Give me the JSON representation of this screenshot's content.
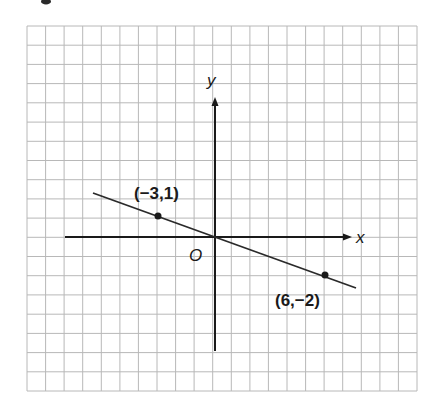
{
  "figure": {
    "type": "coordinate-plane-line",
    "colors": {
      "grid": "#b8b8b8",
      "ink": "#1a1a1a",
      "background": "#ffffff"
    }
  },
  "axes": {
    "x_label": "x",
    "y_label": "y",
    "origin_label": "O"
  },
  "points": [
    {
      "label": "(−3,1)",
      "x": -3,
      "y": 1
    },
    {
      "label": "(6,−2)",
      "x": 6,
      "y": -2
    }
  ],
  "chart_data": {
    "type": "line",
    "title": "",
    "xlabel": "x",
    "ylabel": "y",
    "grid": true,
    "grid_columns": 21,
    "grid_rows": 19,
    "xlim": [
      -8,
      6.5
    ],
    "ylim": [
      -6,
      8
    ],
    "series": [
      {
        "name": "line through (-3,1) and (6,-2)",
        "points": [
          {
            "x": -3,
            "y": 1
          },
          {
            "x": 6,
            "y": -2
          }
        ],
        "slope": -0.3333,
        "intercept": 0,
        "drawn_from": {
          "x": -6.5,
          "y": 2.17
        },
        "drawn_to": {
          "x": 7.6,
          "y": -2.6
        }
      }
    ],
    "annotations": [
      "(−3,1)",
      "(6,−2)",
      "O",
      "x",
      "y"
    ]
  }
}
